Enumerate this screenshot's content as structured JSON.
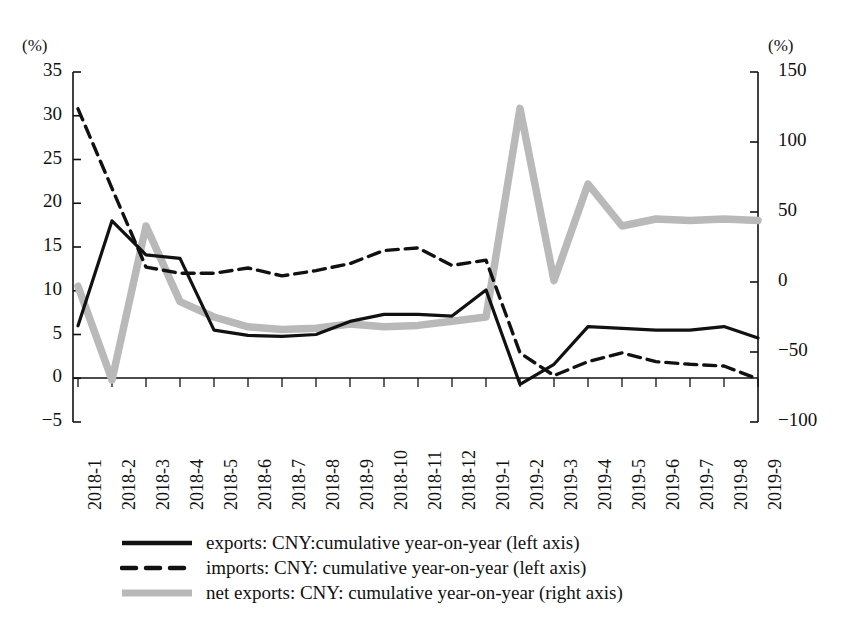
{
  "axes": {
    "left_unit": "(%)",
    "right_unit": "(%)",
    "left_ticks": [
      "35",
      "30",
      "25",
      "20",
      "15",
      "10",
      "5",
      "0",
      "-5"
    ],
    "right_ticks": [
      "150",
      "100",
      "50",
      "0",
      "-50",
      "-100"
    ]
  },
  "legend": {
    "items": [
      {
        "key": "solid-line-key",
        "label": "exports: CNY:cumulative year-on-year (left axis)"
      },
      {
        "key": "dashed-line-key",
        "label": "imports: CNY: cumulative year-on-year (left axis)"
      },
      {
        "key": "gray-line-key",
        "label": "net exports: CNY: cumulative year-on-year (right axis)"
      }
    ]
  },
  "colors": {
    "exports": "#111111",
    "imports": "#111111",
    "net_exports": "#b9b9b9",
    "axis": "#111111"
  },
  "chart_data": {
    "type": "line",
    "title": "",
    "xlabel": "",
    "ylabel": "(%)",
    "y2label": "(%)",
    "ylim": [
      -5,
      35
    ],
    "y2lim": [
      -100,
      150
    ],
    "grid": false,
    "legend_position": "bottom",
    "categories": [
      "2018-1",
      "2018-2",
      "2018-3",
      "2018-4",
      "2018-5",
      "2018-6",
      "2018-7",
      "2018-8",
      "2018-9",
      "2018-10",
      "2018-11",
      "2018-12",
      "2019-1",
      "2019-2",
      "2019-3",
      "2019-4",
      "2019-5",
      "2019-6",
      "2019-7",
      "2019-8",
      "2019-9"
    ],
    "series": [
      {
        "name": "exports: CNY:cumulative year-on-year (left axis)",
        "axis": "left",
        "style": "solid",
        "values": [
          6.0,
          18.0,
          14.1,
          13.7,
          5.5,
          4.9,
          4.8,
          5.0,
          6.5,
          7.3,
          7.3,
          7.1,
          10.1,
          -0.7,
          1.6,
          5.9,
          5.7,
          5.5,
          5.5,
          5.9,
          4.6
        ]
      },
      {
        "name": "imports: CNY: cumulative year-on-year (left axis)",
        "axis": "left",
        "style": "dashed",
        "values": [
          30.8,
          21.7,
          12.7,
          12.0,
          12.0,
          12.6,
          11.7,
          12.3,
          13.1,
          14.6,
          14.9,
          12.9,
          13.5,
          2.9,
          0.3,
          1.9,
          2.9,
          1.9,
          1.6,
          1.4,
          -0.1
        ]
      },
      {
        "name": "net exports: CNY: cumulative year-on-year (right axis)",
        "axis": "right",
        "style": "solid-gray",
        "values": [
          -3,
          -70,
          40,
          -14,
          -25,
          -32,
          -34,
          -33,
          -30,
          -32,
          -31,
          -28,
          -25,
          124,
          1,
          70,
          40,
          45,
          44,
          45,
          44
        ]
      }
    ]
  }
}
